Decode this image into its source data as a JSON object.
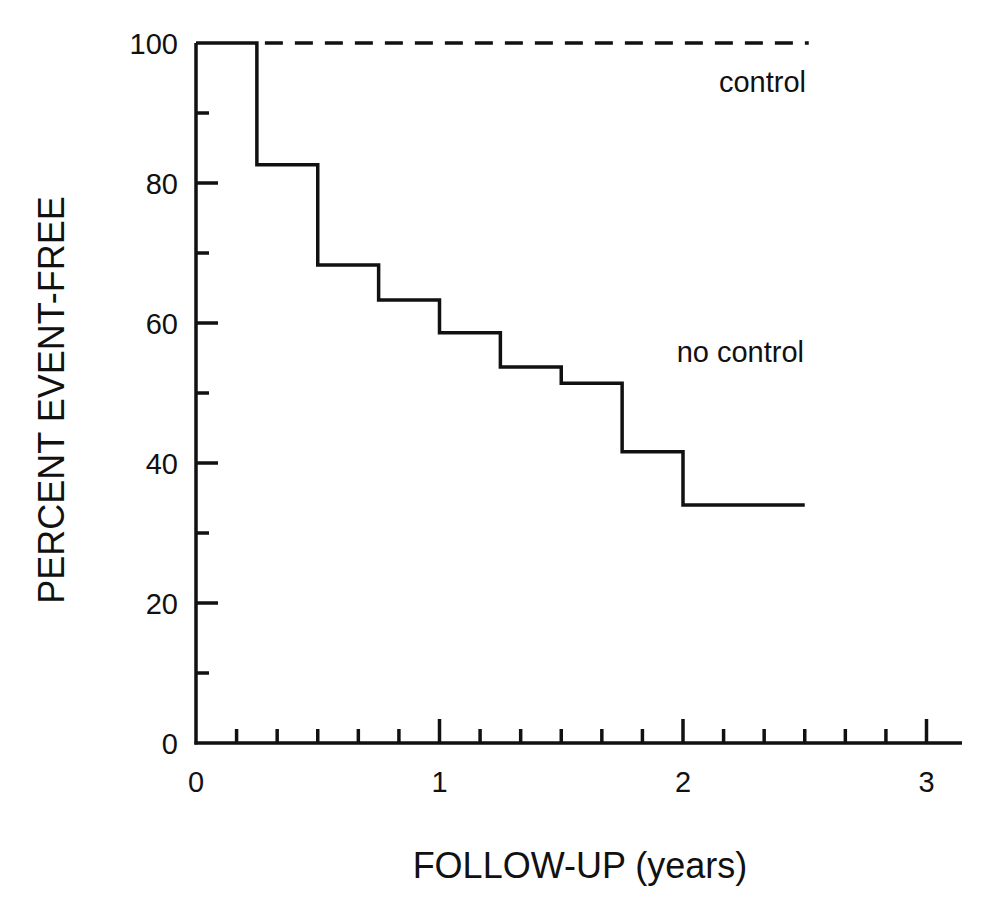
{
  "chart_data": {
    "type": "line",
    "subtype": "step (Kaplan-Meier survival curve)",
    "title": "",
    "xlabel": "FOLLOW-UP (years)",
    "ylabel": "PERCENT EVENT-FREE",
    "xlim": [
      0,
      3.15
    ],
    "ylim": [
      0,
      100
    ],
    "x_ticks_major": [
      0,
      1,
      2,
      3
    ],
    "x_tick_labels": [
      "0",
      "1",
      "2",
      "3"
    ],
    "x_minor_tick_step": 0.1667,
    "y_ticks_major": [
      0,
      20,
      40,
      60,
      80,
      100
    ],
    "y_tick_labels": [
      "0",
      "20",
      "40",
      "60",
      "80",
      "100"
    ],
    "y_minor_tick_step": 10,
    "grid": false,
    "legend": "inline labels",
    "series": [
      {
        "name": "control",
        "style": "dashed",
        "x": [
          0.25,
          2.5
        ],
        "y": [
          100,
          100
        ]
      },
      {
        "name": "no control",
        "style": "solid step",
        "x": [
          0,
          0.25,
          0.5,
          0.75,
          1.0,
          1.25,
          1.5,
          1.75,
          2.0,
          2.5
        ],
        "y": [
          100,
          82.6,
          68.3,
          63.3,
          58.6,
          53.7,
          51.4,
          41.6,
          34.0,
          34.0
        ]
      }
    ],
    "annotations": [
      {
        "text": "control",
        "x": 2.5,
        "y": 95
      },
      {
        "text": "no control",
        "x": 2.5,
        "y": 56
      }
    ]
  },
  "labels": {
    "xlabel": "FOLLOW-UP (years)",
    "ylabel": "PERCENT EVENT-FREE",
    "control": "control",
    "no_control": "no control"
  },
  "colors": {
    "ink": "#111111",
    "background": "#ffffff"
  }
}
